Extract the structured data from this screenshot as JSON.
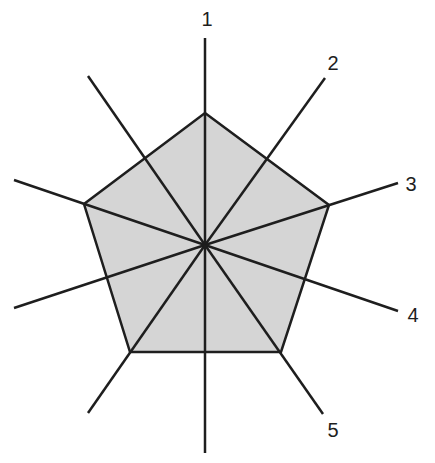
{
  "diagram": {
    "type": "radial-pentagon",
    "center": [
      205,
      245
    ],
    "colors": {
      "fill": "#d5d5d5",
      "stroke": "#1e1e1e",
      "background": "#ffffff"
    },
    "pentagon": [
      [
        205,
        113
      ],
      [
        329,
        205
      ],
      [
        281,
        352
      ],
      [
        130,
        352
      ],
      [
        84,
        204
      ]
    ],
    "labeled_axes": [
      {
        "label": "1",
        "end": [
          205,
          38
        ],
        "label_pos": [
          207,
          26
        ]
      },
      {
        "label": "2",
        "end": [
          325,
          78
        ],
        "label_pos": [
          333,
          70
        ]
      },
      {
        "label": "3",
        "end": [
          398,
          183
        ],
        "label_pos": [
          411,
          191
        ]
      },
      {
        "label": "4",
        "end": [
          398,
          311
        ],
        "label_pos": [
          413,
          322
        ]
      },
      {
        "label": "5",
        "end": [
          323,
          414
        ],
        "label_pos": [
          333,
          437
        ]
      }
    ],
    "unlabeled_axes": [
      {
        "end": [
          88,
          76
        ]
      },
      {
        "end": [
          14,
          180
        ]
      },
      {
        "end": [
          14,
          308
        ]
      },
      {
        "end": [
          88,
          413
        ]
      },
      {
        "end": [
          205,
          453
        ]
      }
    ]
  }
}
